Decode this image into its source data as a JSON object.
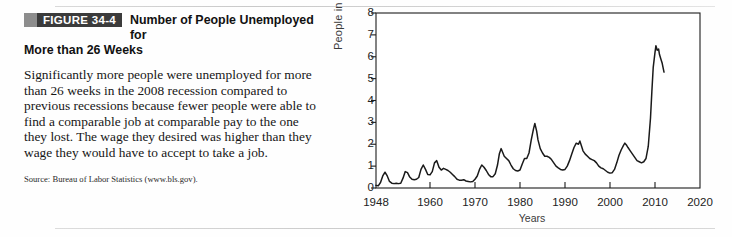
{
  "figure": {
    "badge_label": "FIGURE 34-4",
    "title_line1": "Number of People Unemployed for",
    "title_line2": "More than 26 Weeks",
    "body": "Significantly more people were unemployed for more than 26 weeks in the 2008 recession compared to previous recessions because fewer people were able to find a comparable job at comparable pay to the one they lost. The wage they desired was higher than they wage they would have to accept to take a job.",
    "source": "Source: Bureau of Labor Statistics (www.bls.gov).",
    "badge_bg": "#3b3b3b",
    "badge_fg": "#ffffff",
    "square_color": "#8d8d8d"
  },
  "chart_data": {
    "type": "line",
    "title": "Number of People Unemployed for More than 26 Weeks",
    "xlabel": "Years",
    "ylabel": "People in millions",
    "xlim": [
      1948,
      2020
    ],
    "ylim": [
      0,
      8
    ],
    "yticks": [
      0,
      1,
      2,
      3,
      4,
      5,
      6,
      7,
      8
    ],
    "xticks": [
      1948,
      1960,
      1970,
      1980,
      1990,
      2000,
      2010,
      2020
    ],
    "grid": false,
    "legend": "none",
    "line_color": "#1a1a1a",
    "series": [
      {
        "name": "Unemployed 27 weeks and over",
        "x": [
          1948.0,
          1948.5,
          1949.0,
          1949.5,
          1950.0,
          1950.5,
          1951.0,
          1951.5,
          1952.0,
          1952.5,
          1953.0,
          1953.5,
          1954.0,
          1954.5,
          1955.0,
          1955.5,
          1956.0,
          1956.5,
          1957.0,
          1957.5,
          1958.0,
          1958.5,
          1959.0,
          1959.5,
          1960.0,
          1960.5,
          1961.0,
          1961.5,
          1962.0,
          1962.5,
          1963.0,
          1963.5,
          1964.0,
          1964.5,
          1965.0,
          1965.5,
          1966.0,
          1966.5,
          1967.0,
          1967.5,
          1968.0,
          1968.5,
          1969.0,
          1969.5,
          1970.0,
          1970.5,
          1971.0,
          1971.5,
          1972.0,
          1972.5,
          1973.0,
          1973.5,
          1974.0,
          1974.5,
          1975.0,
          1975.4,
          1975.8,
          1976.0,
          1976.5,
          1977.0,
          1977.5,
          1978.0,
          1978.5,
          1979.0,
          1979.5,
          1980.0,
          1980.5,
          1981.0,
          1981.5,
          1982.0,
          1982.5,
          1983.0,
          1983.3,
          1983.7,
          1984.0,
          1984.5,
          1985.0,
          1985.5,
          1986.0,
          1986.5,
          1987.0,
          1987.5,
          1988.0,
          1988.5,
          1989.0,
          1989.5,
          1990.0,
          1990.5,
          1991.0,
          1991.5,
          1992.0,
          1992.5,
          1993.0,
          1993.3,
          1993.7,
          1994.0,
          1994.5,
          1995.0,
          1995.5,
          1996.0,
          1996.5,
          1997.0,
          1997.5,
          1998.0,
          1998.5,
          1999.0,
          1999.5,
          2000.0,
          2000.5,
          2001.0,
          2001.5,
          2002.0,
          2002.5,
          2003.0,
          2003.3,
          2003.7,
          2004.0,
          2004.5,
          2005.0,
          2005.5,
          2006.0,
          2006.5,
          2007.0,
          2007.5,
          2008.0,
          2008.5,
          2009.0,
          2009.3,
          2009.6,
          2010.0,
          2010.2,
          2010.5,
          2010.8,
          2011.0,
          2011.3,
          2011.6,
          2012.0
        ],
        "y": [
          0.12,
          0.1,
          0.25,
          0.55,
          0.72,
          0.55,
          0.3,
          0.22,
          0.2,
          0.22,
          0.2,
          0.22,
          0.45,
          0.75,
          0.7,
          0.5,
          0.4,
          0.38,
          0.4,
          0.48,
          0.85,
          1.05,
          0.85,
          0.62,
          0.6,
          0.75,
          1.15,
          1.25,
          0.95,
          0.82,
          0.9,
          0.85,
          0.8,
          0.72,
          0.62,
          0.52,
          0.4,
          0.36,
          0.35,
          0.38,
          0.32,
          0.3,
          0.28,
          0.3,
          0.4,
          0.55,
          0.85,
          1.05,
          0.95,
          0.8,
          0.62,
          0.52,
          0.52,
          0.65,
          1.05,
          1.55,
          1.8,
          1.7,
          1.45,
          1.35,
          1.25,
          1.05,
          0.88,
          0.8,
          0.78,
          0.82,
          1.1,
          1.35,
          1.35,
          1.6,
          2.2,
          2.7,
          2.95,
          2.6,
          2.2,
          1.8,
          1.6,
          1.45,
          1.45,
          1.4,
          1.3,
          1.15,
          1.0,
          0.92,
          0.85,
          0.82,
          0.85,
          1.0,
          1.25,
          1.55,
          1.85,
          2.05,
          2.0,
          2.15,
          1.9,
          1.7,
          1.55,
          1.45,
          1.35,
          1.3,
          1.25,
          1.15,
          1.0,
          0.92,
          0.88,
          0.8,
          0.72,
          0.68,
          0.7,
          0.85,
          1.15,
          1.5,
          1.75,
          1.95,
          2.05,
          1.95,
          1.85,
          1.7,
          1.55,
          1.4,
          1.25,
          1.2,
          1.15,
          1.2,
          1.35,
          1.9,
          3.2,
          4.4,
          5.5,
          6.2,
          6.5,
          6.3,
          6.35,
          6.1,
          5.9,
          5.7,
          5.3
        ]
      }
    ],
    "annotations": []
  }
}
